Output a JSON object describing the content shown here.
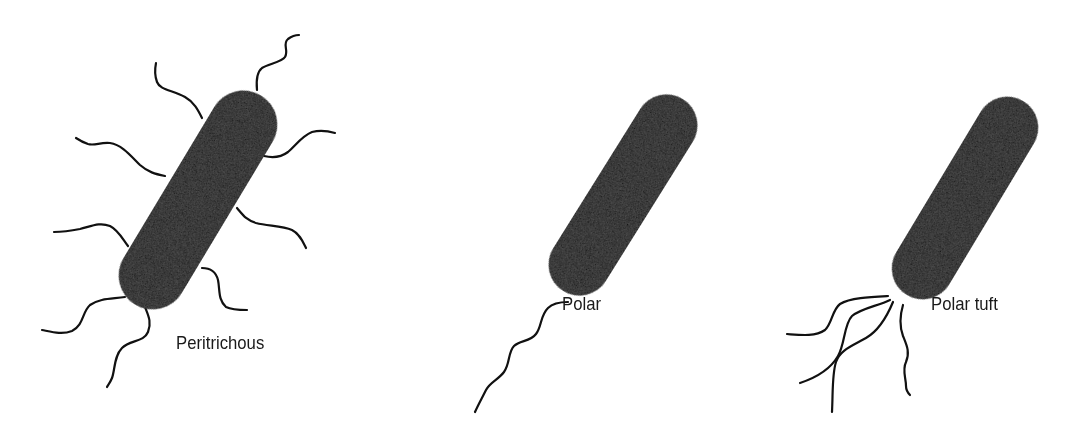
{
  "figure": {
    "background": "#ffffff",
    "ink_color": "#0d0d0d",
    "panels": [
      {
        "id": "peritrichous",
        "label": "Peritrichous",
        "flagella_count": 9,
        "arrangement": "flagella distributed over entire cell surface"
      },
      {
        "id": "polar",
        "label": "Polar",
        "flagella_count": 1,
        "arrangement": "single flagellum at one pole"
      },
      {
        "id": "polar-tuft",
        "label": "Polar tuft",
        "flagella_count": 4,
        "arrangement": "tuft of flagella at one pole"
      }
    ]
  }
}
